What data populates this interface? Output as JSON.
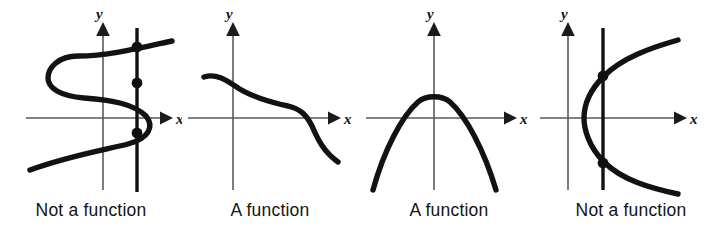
{
  "figure": {
    "background_color": "#ffffff",
    "curve_color": "#121212",
    "axis_color": "#5a5a5a",
    "text_color": "#141414",
    "width": 722,
    "height": 245
  },
  "panels": [
    {
      "id": "panel-1",
      "caption": "Not a function",
      "x_label": "x",
      "y_label": "y",
      "curve_type": "sideways-s-curve",
      "has_vertical_test_line": true,
      "intersection_count": 3,
      "verdict": "not-a-function"
    },
    {
      "id": "panel-2",
      "caption": "A function",
      "x_label": "x",
      "y_label": "y",
      "curve_type": "decreasing-cubic",
      "has_vertical_test_line": false,
      "intersection_count": 0,
      "verdict": "a-function"
    },
    {
      "id": "panel-3",
      "caption": "A function",
      "x_label": "x",
      "y_label": "y",
      "curve_type": "downward-parabola",
      "has_vertical_test_line": false,
      "intersection_count": 0,
      "verdict": "a-function"
    },
    {
      "id": "panel-4",
      "caption": "Not a function",
      "x_label": "x",
      "y_label": "y",
      "curve_type": "sideways-parabola",
      "has_vertical_test_line": true,
      "intersection_count": 2,
      "verdict": "not-a-function"
    }
  ]
}
